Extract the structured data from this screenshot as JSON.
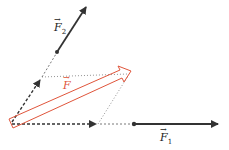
{
  "diagram": {
    "type": "vector-parallelogram",
    "colors": {
      "vector": "#333333",
      "resultant": "#e0553b",
      "guide": "#555555"
    },
    "labels": {
      "f1": {
        "base": "F",
        "sub": "1",
        "arrow": "→"
      },
      "f2": {
        "base": "F",
        "sub": "2",
        "arrow": "→"
      },
      "f": {
        "base": "F",
        "sub": "",
        "arrow": "→"
      }
    }
  }
}
